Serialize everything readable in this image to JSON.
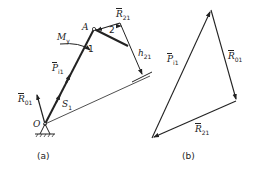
{
  "figure_a": {
    "caption": "(a)",
    "points": {
      "O": "O",
      "A": "A"
    },
    "link_labels": {
      "link1": "1",
      "link2": "2"
    },
    "forces": {
      "R01": {
        "symbol": "R",
        "sub": "01"
      },
      "Pi1": {
        "symbol": "P",
        "sub": "i1"
      },
      "R21": {
        "symbol": "R",
        "sub": "21"
      }
    },
    "moment": {
      "symbol": "M",
      "sub": "y"
    },
    "displacement": {
      "symbol": "S",
      "sub": "1"
    },
    "lever_arm": {
      "symbol": "h",
      "sub": "21"
    }
  },
  "figure_b": {
    "caption": "(b)",
    "forces": {
      "Pi1": {
        "symbol": "P",
        "sub": "i1"
      },
      "R01": {
        "symbol": "R",
        "sub": "01"
      },
      "R21": {
        "symbol": "R",
        "sub": "21"
      }
    }
  },
  "colors": {
    "ink": "#222222",
    "background": "#ffffff"
  }
}
